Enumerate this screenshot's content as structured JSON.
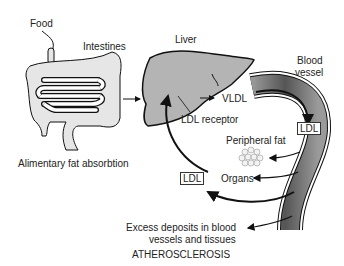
{
  "labels": {
    "food": "Food",
    "intestines": "Intestines",
    "liver": "Liver",
    "blood_vessel_line1": "Blood",
    "blood_vessel_line2": "vessel",
    "vldl": "VLDL",
    "ldl_receptor": "LDL receptor",
    "ldl_vessel": "LDL",
    "peripheral_fat": "Peripheral fat",
    "organs": "Organs",
    "ldl_return": "LDL",
    "alimentary": "Alimentary fat absorbtion",
    "excess_line1": "Excess deposits in blood",
    "excess_line2": "vessels and tissues",
    "atherosclerosis": "ATHEROSCLEROSIS"
  },
  "colors": {
    "liver_fill": "#b4b4b4",
    "intestine_fill": "#e6e6e6",
    "vessel_dark": "#6e6e6e",
    "outline": "#111111"
  }
}
